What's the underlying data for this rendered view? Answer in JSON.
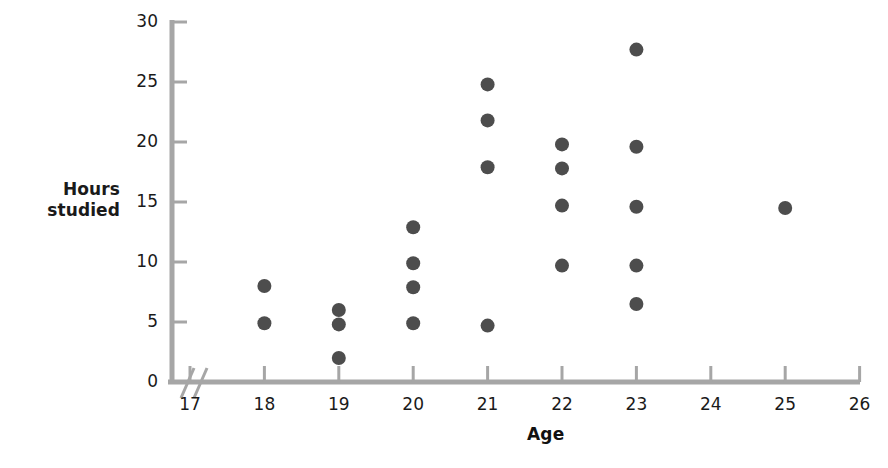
{
  "chart_data": {
    "type": "scatter",
    "title": "",
    "xlabel": "Age",
    "ylabel": "Hours studied",
    "ylabel_line1": "Hours",
    "ylabel_line2": "studied",
    "xlim": [
      16.7,
      26
    ],
    "ylim": [
      0,
      30
    ],
    "x_ticks": [
      17,
      18,
      19,
      20,
      21,
      22,
      23,
      24,
      25,
      26
    ],
    "y_ticks": [
      0,
      5,
      10,
      15,
      20,
      25,
      30
    ],
    "x_tick_labels": [
      "17",
      "18",
      "19",
      "20",
      "21",
      "22",
      "23",
      "24",
      "25",
      "26"
    ],
    "y_tick_labels": [
      "0",
      "5",
      "10",
      "15",
      "20",
      "25",
      "30"
    ],
    "grid": false,
    "legend": false,
    "axis_break": true,
    "axis_break_symbol": "//",
    "marker_color": "#4d4d4d",
    "axis_color": "#a6a6a6",
    "marker_radius": 7,
    "points": [
      {
        "x": 18,
        "y": 8.0
      },
      {
        "x": 18,
        "y": 4.9
      },
      {
        "x": 19,
        "y": 6.0
      },
      {
        "x": 19,
        "y": 4.8
      },
      {
        "x": 19,
        "y": 2.0
      },
      {
        "x": 20,
        "y": 12.9
      },
      {
        "x": 20,
        "y": 9.9
      },
      {
        "x": 20,
        "y": 7.9
      },
      {
        "x": 20,
        "y": 4.9
      },
      {
        "x": 21,
        "y": 24.8
      },
      {
        "x": 21,
        "y": 21.8
      },
      {
        "x": 21,
        "y": 17.9
      },
      {
        "x": 21,
        "y": 4.7
      },
      {
        "x": 22,
        "y": 19.8
      },
      {
        "x": 22,
        "y": 17.8
      },
      {
        "x": 22,
        "y": 14.7
      },
      {
        "x": 22,
        "y": 9.7
      },
      {
        "x": 23,
        "y": 27.7
      },
      {
        "x": 23,
        "y": 19.6
      },
      {
        "x": 23,
        "y": 14.6
      },
      {
        "x": 23,
        "y": 9.7
      },
      {
        "x": 23,
        "y": 6.5
      },
      {
        "x": 25,
        "y": 14.5
      }
    ]
  }
}
